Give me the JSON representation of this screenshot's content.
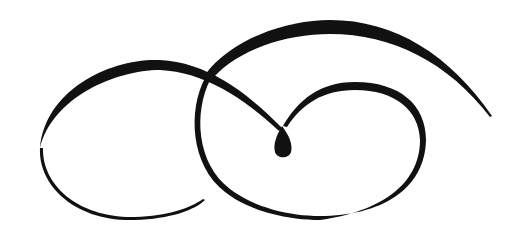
{
  "image": {
    "kind": "calligraphic-flourish",
    "background": "#ffffff",
    "ink_color": "#111111"
  }
}
